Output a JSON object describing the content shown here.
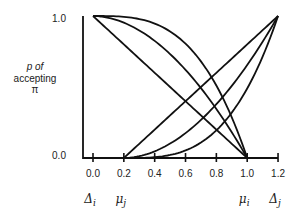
{
  "chart_data": {
    "type": "line",
    "title": "",
    "xlabel": "",
    "ylabel": "p of accepting π",
    "ylabel_lines": [
      "p of",
      "accepting",
      "π"
    ],
    "xlim": [
      0.0,
      1.2
    ],
    "ylim": [
      0.0,
      1.0
    ],
    "grid": false,
    "legend": null,
    "x_ticks": [
      0.0,
      0.2,
      0.4,
      0.6,
      0.8,
      1.0,
      1.2
    ],
    "x_tick_labels": [
      "0.0",
      "0.2",
      "0.4",
      "0.6",
      "0.8",
      "1.0",
      "1.2"
    ],
    "y_ticks": [
      0.0,
      1.0
    ],
    "y_tick_labels": [
      "0.0",
      "1.0"
    ],
    "annotations": [
      {
        "text": "Δi",
        "base": "Δ",
        "sub": "i",
        "x": 0.0
      },
      {
        "text": "μj",
        "base": "μ",
        "sub": "j",
        "x": 0.2
      },
      {
        "text": "μi",
        "base": "μ",
        "sub": "i",
        "x": 1.0
      },
      {
        "text": "Δj",
        "base": "Δ",
        "sub": "j",
        "x": 1.2
      }
    ],
    "series": [
      {
        "name": "i-linear",
        "kind": "descending",
        "from": [
          0.0,
          1.0
        ],
        "to": [
          1.0,
          0.0
        ],
        "exponent": 1.0,
        "x": [
          0.0,
          0.2,
          0.4,
          0.6,
          0.8,
          1.0
        ],
        "values": [
          1.0,
          0.8,
          0.6,
          0.4,
          0.2,
          0.0
        ]
      },
      {
        "name": "i-concave-moderate",
        "kind": "descending",
        "from": [
          0.0,
          1.0
        ],
        "to": [
          1.0,
          0.0
        ],
        "exponent": 1.9,
        "x": [
          0.0,
          0.2,
          0.4,
          0.6,
          0.8,
          1.0
        ],
        "values": [
          1.0,
          0.95,
          0.82,
          0.62,
          0.35,
          0.0
        ]
      },
      {
        "name": "i-concave-strong",
        "kind": "descending",
        "from": [
          0.0,
          1.0
        ],
        "to": [
          1.0,
          0.0
        ],
        "exponent": 3.2,
        "x": [
          0.0,
          0.2,
          0.4,
          0.6,
          0.8,
          1.0
        ],
        "values": [
          1.0,
          0.99,
          0.95,
          0.81,
          0.51,
          0.0
        ]
      },
      {
        "name": "j-linear",
        "kind": "ascending",
        "from": [
          0.2,
          0.0
        ],
        "to": [
          1.2,
          1.0
        ],
        "exponent": 1.0,
        "x": [
          0.2,
          0.4,
          0.6,
          0.8,
          1.0,
          1.2
        ],
        "values": [
          0.0,
          0.2,
          0.4,
          0.6,
          0.8,
          1.0
        ]
      },
      {
        "name": "j-convex-moderate",
        "kind": "ascending",
        "from": [
          0.2,
          0.0
        ],
        "to": [
          1.2,
          1.0
        ],
        "exponent": 1.9,
        "x": [
          0.2,
          0.4,
          0.6,
          0.8,
          1.0,
          1.2
        ],
        "values": [
          0.0,
          0.05,
          0.18,
          0.38,
          0.65,
          1.0
        ]
      },
      {
        "name": "j-convex-strong",
        "kind": "ascending",
        "from": [
          0.2,
          0.0
        ],
        "to": [
          1.2,
          1.0
        ],
        "exponent": 3.2,
        "x": [
          0.2,
          0.4,
          0.6,
          0.8,
          1.0,
          1.2
        ],
        "values": [
          0.0,
          0.01,
          0.05,
          0.19,
          0.49,
          1.0
        ]
      }
    ]
  },
  "style": {
    "ink": "#111111",
    "background": "#ffffff"
  }
}
